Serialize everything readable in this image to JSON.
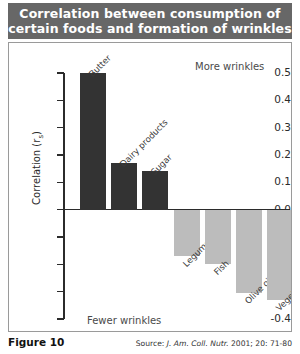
{
  "title": {
    "line1": "Correlation between consumption of",
    "line2": "certain foods and formation of wrinkles"
  },
  "caption": {
    "figure_number": "Figure 10",
    "source_prefix": "Source:",
    "source_journal": "J. Am. Coll. Nutr.",
    "source_citation": "2001; 20: 71-80"
  },
  "colors": {
    "banner": "#676767",
    "positive_bar": "#333333",
    "negative_bar": "#bcbcbc",
    "axis": "#2b2b2b",
    "frame": "#9a9a9a"
  },
  "chart_data": {
    "type": "bar",
    "title": "Correlation between consumption of certain foods and formation of wrinkles",
    "xlabel": "",
    "ylabel": "Correlation (rs)",
    "ylabel_main": "Correlation (r",
    "ylabel_sub": "s",
    "ylabel_tail": ")",
    "categories": [
      "Butter",
      "Dairy products",
      "Sugar",
      "Legumes",
      "Fish",
      "Olive oil",
      "Vegetables"
    ],
    "values": [
      0.5,
      0.17,
      0.14,
      -0.17,
      -0.2,
      -0.305,
      -0.33
    ],
    "ylim": [
      -0.4,
      0.5
    ],
    "yticks": [
      0.5,
      0.4,
      0.3,
      0.2,
      0.1,
      0.0,
      -0.1,
      -0.2,
      -0.3,
      -0.4
    ],
    "ytick_labels": [
      "0.5",
      "0.4",
      "0.3",
      "0.2",
      "0.1",
      "0.0",
      "-0.1",
      "-0.2",
      "-0.3",
      "-0.4"
    ],
    "grid": false,
    "legend": false,
    "annotations": [
      {
        "text": "More wrinkles",
        "position": "top-right"
      },
      {
        "text": "Fewer wrinkles",
        "position": "bottom-left"
      }
    ]
  }
}
